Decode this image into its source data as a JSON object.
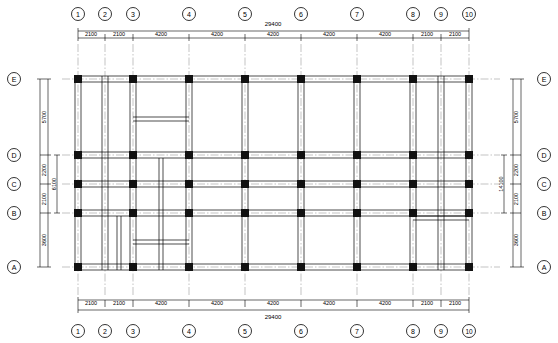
{
  "drawing": {
    "type": "structural-framing-plan",
    "total_span_label": "29400",
    "grid_columns": [
      "1",
      "2",
      "3",
      "4",
      "5",
      "6",
      "7",
      "8",
      "9",
      "10"
    ],
    "grid_rows": [
      "A",
      "B",
      "C",
      "D",
      "E"
    ],
    "top_dimensions": [
      "2100",
      "2100",
      "4200",
      "4200",
      "4200",
      "4200",
      "4200",
      "2100",
      "2100"
    ],
    "bottom_dimensions": [
      "2100",
      "2100",
      "4200",
      "4200",
      "4200",
      "4200",
      "4200",
      "2100",
      "2100"
    ],
    "left_dimensions": [
      "5700",
      "2200",
      "2100",
      "3600"
    ],
    "right_dimensions": [
      "5700",
      "2200",
      "2100",
      "3600"
    ],
    "left_overall": [
      "6100",
      "14100"
    ],
    "right_overall": [
      "14100"
    ],
    "colors": {
      "line": "#000000",
      "column_fill": "#1a1a1a",
      "axis": "#000000",
      "background": "#ffffff"
    }
  }
}
